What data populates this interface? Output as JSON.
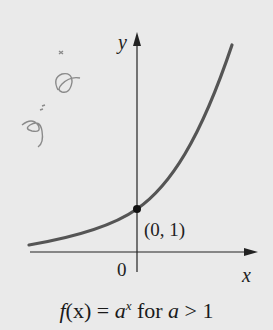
{
  "figure": {
    "y_axis_label": "y",
    "x_axis_label": "x",
    "origin_label": "0",
    "point_label": "(0, 1)",
    "handwritten_note": "y = a^x",
    "caption": {
      "func": "f",
      "arg": "(x) = ",
      "base": "a",
      "exp": "x",
      "rest": " for ",
      "cond_var": "a",
      "cond_rest": " > 1"
    },
    "colors": {
      "background": "#eaeaea",
      "curve": "#555555",
      "axes": "#222222",
      "handwriting": "#8a8a8a"
    }
  }
}
